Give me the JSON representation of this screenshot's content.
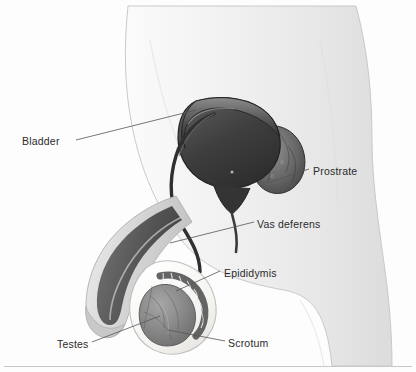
{
  "figure": {
    "type": "anatomical-illustration",
    "style": "grayscale halftone drawing on white background",
    "background_color": "#fdfdfd",
    "label_color": "#2b2b2b",
    "leader_line_color": "#555555",
    "body_fill": "#f2f2f2",
    "body_edge": "#b9b9b9",
    "organ_dark": "#3a3a3a",
    "organ_mid": "#6f6f6f",
    "organ_light": "#a8a8a8",
    "scrotum_fill": "#f7f6f3",
    "testis_fill": "#8d8d8d"
  },
  "labels": [
    {
      "id": "bladder",
      "text": "Bladder",
      "x": 22,
      "y": 136
    },
    {
      "id": "prostrate",
      "text": "Prostrate",
      "x": 313,
      "y": 166
    },
    {
      "id": "vas-deferens",
      "text": "Vas deferens",
      "x": 257,
      "y": 219
    },
    {
      "id": "epididymis",
      "text": "Epididymis",
      "x": 224,
      "y": 268
    },
    {
      "id": "testes",
      "text": "Testes",
      "x": 57,
      "y": 339
    },
    {
      "id": "scrotum",
      "text": "Scrotum",
      "x": 228,
      "y": 338
    }
  ],
  "leader_lines": [
    {
      "id": "bladder-leader",
      "from": [
        76,
        140
      ],
      "to": [
        196,
        110
      ]
    },
    {
      "id": "prostrate-leader",
      "from": [
        309,
        169
      ],
      "to": [
        268,
        183
      ]
    },
    {
      "id": "vas-deferens-leader",
      "from": [
        254,
        222
      ],
      "to": [
        170,
        243
      ]
    },
    {
      "id": "epididymis-leader",
      "from": [
        220,
        271
      ],
      "to": [
        176,
        291
      ]
    },
    {
      "id": "testes-leader",
      "from": [
        92,
        342
      ],
      "to": [
        160,
        316
      ]
    },
    {
      "id": "scrotum-leader",
      "from": [
        225,
        341
      ],
      "to": [
        168,
        330
      ]
    }
  ],
  "rule": {
    "id": "bottom-rule",
    "y": 366
  }
}
